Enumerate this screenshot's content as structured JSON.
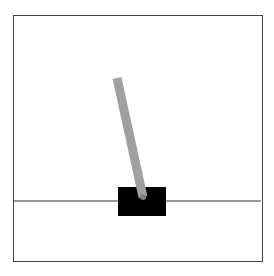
{
  "environment": {
    "name": "CartPole",
    "colors": {
      "background": "#ffffff",
      "border": "#444444",
      "track": "#333333",
      "cart": "#000000",
      "pole": "#a0a0a0",
      "axle": "#808080"
    },
    "track": {
      "y": 201,
      "x1": 14,
      "x2": 261
    },
    "cart": {
      "x": 118,
      "y": 187,
      "width": 48,
      "height": 29
    },
    "pole": {
      "x1": 143,
      "y1": 197,
      "x2": 117,
      "y2": 78,
      "width": 9
    }
  }
}
